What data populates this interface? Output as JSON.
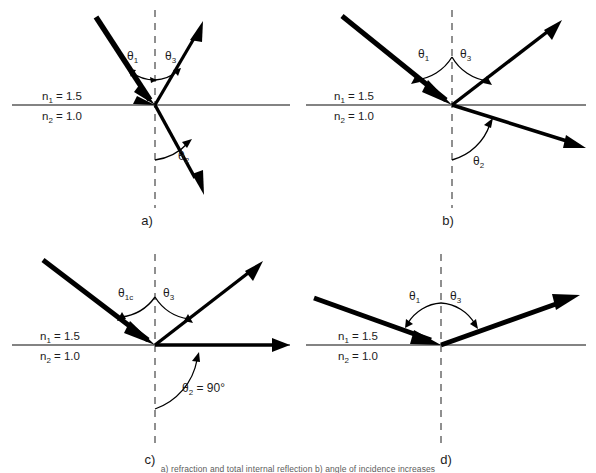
{
  "figure": {
    "title_caption": "a) refraction and total internal reflection b) angle of incidence increases",
    "background_color": "#ffffff",
    "ray_color": "#000000",
    "interface_color": "#5a5a5a",
    "normal_color": "#6b6b6b",
    "text_color": "#1c1c1c"
  },
  "common_labels": {
    "n1": "n",
    "n1_sub": "1",
    "n1_value": " = 1.5",
    "n2": "n",
    "n2_sub": "2",
    "n2_value": " = 1.0",
    "theta": "θ",
    "theta1_sub": "1",
    "theta2_sub": "2",
    "theta3_sub": "3",
    "theta1c_sub": "1c",
    "theta2_value": " = 90°"
  },
  "panels": [
    {
      "id": "a",
      "letter": "a)",
      "n1_label": "n₁ = 1.5",
      "n2_label": "n₂ = 1.0",
      "incident_angle_label": "θ₁",
      "reflected_angle_label": "θ₃",
      "refracted_angle_label": "θ₂",
      "incidence_angle_deg": 30,
      "reflection_angle_deg": 30,
      "refraction_angle_deg": 49,
      "has_refracted_ray": true,
      "has_reflected_ray": true,
      "description": "small angle of incidence, refracted ray bends away from normal"
    },
    {
      "id": "b",
      "letter": "b)",
      "n1_label": "n₁ = 1.5",
      "n2_label": "n₂ = 1.0",
      "incident_angle_label": "θ₁",
      "reflected_angle_label": "θ₃",
      "refracted_angle_label": "θ₂",
      "incidence_angle_deg": 45,
      "reflection_angle_deg": 45,
      "refraction_angle_deg": 73,
      "has_refracted_ray": true,
      "has_reflected_ray": true,
      "description": "angle of incidence increases, refracted ray closer to interface"
    },
    {
      "id": "c",
      "letter": "c)",
      "n1_label": "n₁ = 1.5",
      "n2_label": "n₂ = 1.0",
      "incident_angle_label": "θ₁c",
      "reflected_angle_label": "θ₃",
      "refracted_angle_label": "θ₂ = 90°",
      "incidence_angle_deg": 42,
      "reflection_angle_deg": 42,
      "refraction_angle_deg": 90,
      "has_refracted_ray": true,
      "has_reflected_ray": true,
      "description": "critical angle, refracted ray travels along the interface"
    },
    {
      "id": "d",
      "letter": "d)",
      "n1_label": "n₁ = 1.5",
      "n2_label": "n₂ = 1.0",
      "incident_angle_label": "θ₁",
      "reflected_angle_label": "θ₃",
      "refracted_angle_label": "",
      "incidence_angle_deg": 71,
      "reflection_angle_deg": 71,
      "refraction_angle_deg": null,
      "has_refracted_ray": false,
      "has_reflected_ray": true,
      "description": "beyond critical angle, total internal reflection, no refracted ray"
    }
  ]
}
